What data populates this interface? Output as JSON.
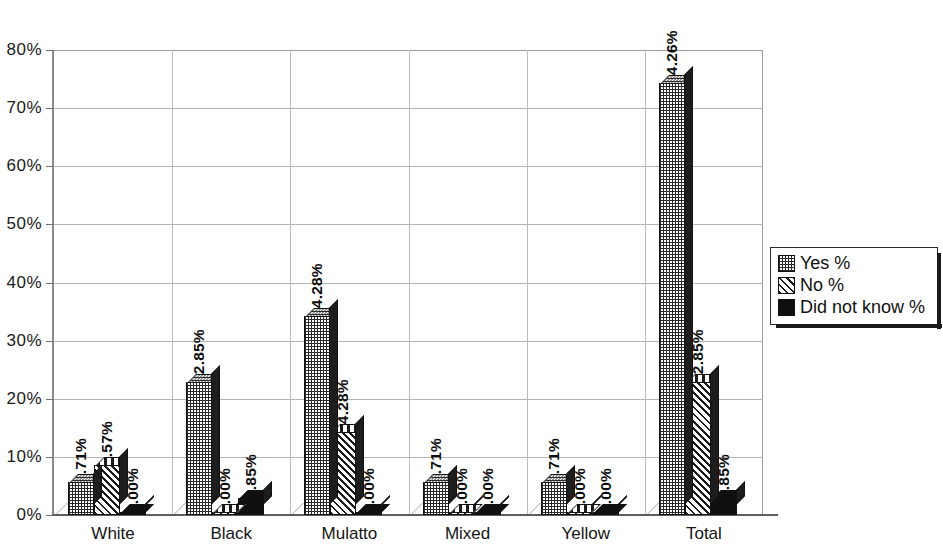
{
  "chart_data": {
    "type": "bar",
    "title": "",
    "subtitle": "",
    "xlabel": "",
    "ylabel": "",
    "ylim": [
      0,
      80
    ],
    "ytick_step": 10,
    "ytick_labels": [
      "0%",
      "10%",
      "20%",
      "30%",
      "40%",
      "50%",
      "60%",
      "70%",
      "80%"
    ],
    "ytick_values": [
      0,
      10,
      20,
      30,
      40,
      50,
      60,
      70,
      80
    ],
    "grid": true,
    "legend_position": "right",
    "value_label_format": "0.00%",
    "categories": [
      "White",
      "Black",
      "Mulatto",
      "Mixed",
      "Yellow",
      "Total"
    ],
    "series": [
      {
        "name": "Yes %",
        "pattern": "checker-dots",
        "color": "#2b2b2b",
        "values": [
          5.71,
          22.85,
          34.28,
          5.71,
          5.71,
          74.26
        ],
        "labels": [
          "5.71%",
          "22.85%",
          "34.28%",
          "5.71%",
          "5.71%",
          "74.26%"
        ]
      },
      {
        "name": "No %",
        "pattern": "diagonal-hatch",
        "color": "#1a1a1a",
        "values": [
          8.57,
          0.0,
          14.28,
          0.0,
          0.0,
          22.85
        ],
        "labels": [
          "8.57%",
          "0.00%",
          "14.28%",
          "0.00%",
          "0.00%",
          "22.85%"
        ]
      },
      {
        "name": "Did not know %",
        "pattern": "solid-black",
        "color": "#101010",
        "values": [
          0.0,
          2.85,
          0.0,
          0.0,
          0.0,
          2.85
        ],
        "labels": [
          "0.00%",
          "2.85%",
          "0.00%",
          "0.00%",
          "0.00%",
          "2.85%"
        ]
      }
    ]
  },
  "legend": {
    "items": [
      {
        "label": "Yes %",
        "swatch": "checker-dots-swatch"
      },
      {
        "label": "No %",
        "swatch": "diagonal-hatch-swatch"
      },
      {
        "label": "Did not know %",
        "swatch": "solid-black-swatch"
      }
    ]
  }
}
